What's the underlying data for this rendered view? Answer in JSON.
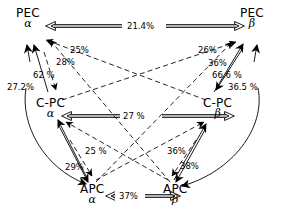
{
  "figure": {
    "type": "homology-percent-diagram",
    "background": "#ffffff",
    "ink": "#000000"
  },
  "nodes": [
    {
      "id": "pec-alpha",
      "name": "PEC",
      "subunit": "α",
      "x": 16,
      "y": 8
    },
    {
      "id": "pec-beta",
      "name": "PEC",
      "subunit": "β",
      "x": 240,
      "y": 8
    },
    {
      "id": "cpc-alpha",
      "name": "C-PC",
      "subunit": "α",
      "x": 36,
      "y": 98
    },
    {
      "id": "cpc-beta",
      "name": "C-PC",
      "subunit": "β",
      "x": 203,
      "y": 98
    },
    {
      "id": "apc-alpha",
      "name": "APC",
      "subunit": "α",
      "x": 80,
      "y": 184
    },
    {
      "id": "apc-beta",
      "name": "APC",
      "subunit": "β",
      "x": 163,
      "y": 184
    }
  ],
  "labels": [
    {
      "id": "l-21-4",
      "text": "21.4%",
      "x": 127,
      "y": 21,
      "pair": "pec-alpha↔pec-beta"
    },
    {
      "id": "l-25a",
      "text": "25%",
      "x": 70,
      "y": 45,
      "pair": "pec-alpha↔cpc-beta"
    },
    {
      "id": "l-28",
      "text": "28%",
      "x": 56,
      "y": 57,
      "pair": "pec-alpha↔apc-beta"
    },
    {
      "id": "l-62",
      "text": "62 %",
      "x": 33,
      "y": 70,
      "pair": "pec-alpha↔cpc-alpha"
    },
    {
      "id": "l-27-2",
      "text": "27.2%",
      "x": 7,
      "y": 82,
      "pair": "pec-alpha↔apc-alpha"
    },
    {
      "id": "l-26",
      "text": "26%",
      "x": 198,
      "y": 45,
      "pair": "pec-beta↔cpc-alpha"
    },
    {
      "id": "l-36a",
      "text": "36%",
      "x": 208,
      "y": 58,
      "pair": "pec-beta↔apc-alpha"
    },
    {
      "id": "l-66-6",
      "text": "66.6 %",
      "x": 212,
      "y": 70,
      "pair": "pec-beta↔cpc-beta"
    },
    {
      "id": "l-36-5",
      "text": "36.5 %",
      "x": 228,
      "y": 82,
      "pair": "pec-beta↔apc-beta"
    },
    {
      "id": "l-27",
      "text": "27 %",
      "x": 123,
      "y": 111,
      "pair": "cpc-alpha↔cpc-beta"
    },
    {
      "id": "l-25b",
      "text": "25 %",
      "x": 85,
      "y": 146,
      "pair": "cpc-alpha↔apc-beta"
    },
    {
      "id": "l-29",
      "text": "29%",
      "x": 65,
      "y": 162,
      "pair": "cpc-alpha↔apc-alpha"
    },
    {
      "id": "l-36b",
      "text": "36%",
      "x": 167,
      "y": 146,
      "pair": "cpc-beta↔apc-alpha"
    },
    {
      "id": "l-38",
      "text": "38%",
      "x": 180,
      "y": 161,
      "pair": "cpc-beta↔apc-beta"
    },
    {
      "id": "l-37",
      "text": "37%",
      "x": 119,
      "y": 191,
      "pair": "apc-alpha↔apc-beta"
    }
  ]
}
